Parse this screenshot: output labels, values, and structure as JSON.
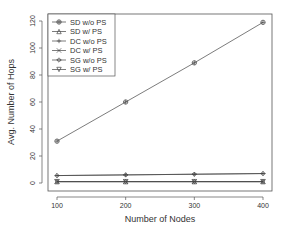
{
  "chart_data": {
    "type": "line",
    "title": "",
    "xlabel": "Number of Nodes",
    "ylabel": "Avg. Number of Hops",
    "x": [
      100,
      200,
      300,
      400
    ],
    "xticks": [
      "100",
      "200",
      "300",
      "400"
    ],
    "yticks": [
      "0",
      "20",
      "40",
      "60",
      "80",
      "100",
      "120"
    ],
    "ylim": [
      0,
      120
    ],
    "xlim": [
      100,
      400
    ],
    "grid": false,
    "legend_position": "top-left",
    "series": [
      {
        "name": "SD w/o PS",
        "marker": "circle-plus",
        "values": [
          31,
          60,
          89,
          119
        ]
      },
      {
        "name": "SD w/ PS",
        "marker": "triangle",
        "values": [
          1,
          1,
          1,
          1
        ]
      },
      {
        "name": "DC w/o PS",
        "marker": "plus",
        "values": [
          5.5,
          6,
          6.5,
          7
        ]
      },
      {
        "name": "DC w/ PS",
        "marker": "x",
        "values": [
          1,
          1,
          1,
          1
        ]
      },
      {
        "name": "SG w/o PS",
        "marker": "diamond",
        "values": [
          5.5,
          6,
          6.5,
          7
        ]
      },
      {
        "name": "SG w/ PS",
        "marker": "triangle-down",
        "values": [
          1,
          1,
          1,
          1
        ]
      }
    ]
  }
}
